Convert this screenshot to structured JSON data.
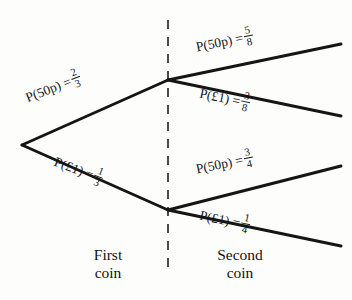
{
  "diagram": {
    "type": "probability-tree",
    "clipped_top_text": "",
    "root": {
      "x": 22,
      "y": 145
    },
    "nodes": [
      {
        "id": "first-50p",
        "x": 168,
        "y": 80
      },
      {
        "id": "first-1pound",
        "x": 168,
        "y": 210
      }
    ],
    "divider": {
      "x": 168,
      "y_top": 20,
      "y_bottom": 275
    },
    "branches": [
      {
        "id": "branch-first-50p",
        "stage": "first",
        "outcome": "50p",
        "label_prefix": "P(50p) =",
        "probability_numerator": "2",
        "probability_denominator": "3",
        "from": {
          "x": 22,
          "y": 145
        },
        "to": {
          "x": 168,
          "y": 80
        }
      },
      {
        "id": "branch-first-1pound",
        "stage": "first",
        "outcome": "£1",
        "label_prefix": "P(£1) =",
        "probability_numerator": "1",
        "probability_denominator": "3",
        "from": {
          "x": 22,
          "y": 145
        },
        "to": {
          "x": 168,
          "y": 210
        }
      },
      {
        "id": "branch-second-50p-upper",
        "stage": "second",
        "outcome": "50p",
        "label_prefix": "P(50p) =",
        "probability_numerator": "5",
        "probability_denominator": "8",
        "from": {
          "x": 168,
          "y": 80
        },
        "to": {
          "x": 341,
          "y": 44
        }
      },
      {
        "id": "branch-second-1pound-upper",
        "stage": "second",
        "outcome": "£1",
        "label_prefix": "P(£1) =",
        "probability_numerator": "3",
        "probability_denominator": "8",
        "from": {
          "x": 168,
          "y": 80
        },
        "to": {
          "x": 341,
          "y": 116
        }
      },
      {
        "id": "branch-second-50p-lower",
        "stage": "second",
        "outcome": "50p",
        "label_prefix": "P(50p) =",
        "probability_numerator": "3",
        "probability_denominator": "4",
        "from": {
          "x": 168,
          "y": 210
        },
        "to": {
          "x": 341,
          "y": 166
        }
      },
      {
        "id": "branch-second-1pound-lower",
        "stage": "second",
        "outcome": "£1",
        "label_prefix": "P(£1) =",
        "probability_numerator": "1",
        "probability_denominator": "4",
        "from": {
          "x": 168,
          "y": 210
        },
        "to": {
          "x": 341,
          "y": 246
        }
      }
    ],
    "captions": {
      "first_line1": "First",
      "first_line2": "coin",
      "second_line1": "Second",
      "second_line2": "coin"
    },
    "colors": {
      "background": "#fdfdfc",
      "ink": "#151515",
      "divider": "#4a4a4a"
    }
  }
}
